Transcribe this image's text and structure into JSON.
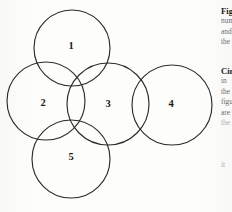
{
  "figure": {
    "kind": "overlapping-circles-diagram",
    "background_color": "#fdfdfc",
    "stroke_color": "#2e2c2b",
    "label_color": "#1d1b1a",
    "canvas": {
      "width": 232,
      "height": 212
    },
    "circles": [
      {
        "label": "1",
        "cx": 72,
        "cy": 48,
        "r": 38,
        "label_x": 71,
        "label_y": 47
      },
      {
        "label": "2",
        "cx": 46,
        "cy": 101,
        "r": 39,
        "label_x": 43,
        "label_y": 104
      },
      {
        "label": "3",
        "cx": 108,
        "cy": 104,
        "r": 41,
        "label_x": 108,
        "label_y": 105
      },
      {
        "label": "4",
        "cx": 172,
        "cy": 105,
        "r": 40,
        "label_x": 171,
        "label_y": 105
      },
      {
        "label": "5",
        "cx": 71,
        "cy": 159,
        "r": 39,
        "label_x": 71,
        "label_y": 158
      }
    ]
  },
  "text_column": {
    "blocks": [
      {
        "top": 6,
        "lines": [
          {
            "text": "Figure",
            "style": "head"
          },
          {
            "text": "number",
            "style": "body"
          },
          {
            "text": "and",
            "style": "body"
          },
          {
            "text": "the",
            "style": "body"
          }
        ]
      },
      {
        "top": 66,
        "lines": [
          {
            "text": "Circles",
            "style": "head"
          },
          {
            "text": "in",
            "style": "body"
          },
          {
            "text": "the",
            "style": "body"
          },
          {
            "text": "figure",
            "style": "body"
          },
          {
            "text": "are",
            "style": "body"
          },
          {
            "text": "the",
            "style": "faint"
          }
        ]
      },
      {
        "top": 160,
        "lines": [
          {
            "text": "it",
            "style": "faint"
          }
        ]
      }
    ]
  }
}
